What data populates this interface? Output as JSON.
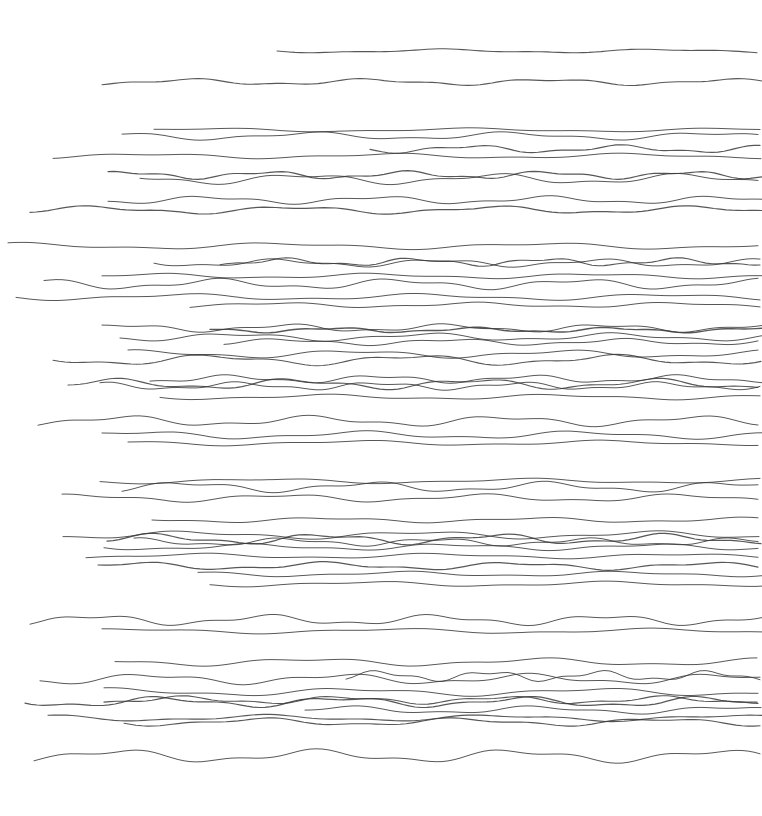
{
  "drawing": {
    "description": "Hand-drawn horizontal wavy pen lines on white paper",
    "background": "#ffffff",
    "stroke_color": "#3a3a3a",
    "width": 762,
    "height": 816,
    "lines": [
      {
        "x1": 277,
        "y": 51,
        "x2": 762,
        "amp": 1.5,
        "wl": 220,
        "w": 1.1
      },
      {
        "x1": 102,
        "y": 82,
        "x2": 762,
        "amp": 2.5,
        "wl": 180,
        "w": 1.1
      },
      {
        "x1": 154,
        "y": 130,
        "x2": 762,
        "amp": 1.5,
        "wl": 260,
        "w": 1.0
      },
      {
        "x1": 122,
        "y": 136,
        "x2": 762,
        "amp": 3,
        "wl": 200,
        "w": 1.0
      },
      {
        "x1": 370,
        "y": 149,
        "x2": 762,
        "amp": 3,
        "wl": 150,
        "w": 1.1
      },
      {
        "x1": 53,
        "y": 156,
        "x2": 762,
        "amp": 2,
        "wl": 240,
        "w": 1.0
      },
      {
        "x1": 108,
        "y": 175,
        "x2": 762,
        "amp": 3,
        "wl": 140,
        "w": 1.2
      },
      {
        "x1": 140,
        "y": 179,
        "x2": 762,
        "amp": 4,
        "wl": 190,
        "w": 1.0
      },
      {
        "x1": 108,
        "y": 200,
        "x2": 762,
        "amp": 3,
        "wl": 170,
        "w": 1.0
      },
      {
        "x1": 30,
        "y": 210,
        "x2": 762,
        "amp": 3,
        "wl": 200,
        "w": 1.2
      },
      {
        "x1": 8,
        "y": 246,
        "x2": 762,
        "amp": 2.5,
        "wl": 260,
        "w": 1.0
      },
      {
        "x1": 154,
        "y": 263,
        "x2": 762,
        "amp": 3,
        "wl": 160,
        "w": 1.0
      },
      {
        "x1": 220,
        "y": 262,
        "x2": 762,
        "amp": 3,
        "wl": 130,
        "w": 1.1
      },
      {
        "x1": 102,
        "y": 276,
        "x2": 762,
        "amp": 2,
        "wl": 220,
        "w": 1.0
      },
      {
        "x1": 44,
        "y": 284,
        "x2": 762,
        "amp": 4,
        "wl": 180,
        "w": 1.0
      },
      {
        "x1": 16,
        "y": 297,
        "x2": 762,
        "amp": 2.5,
        "wl": 240,
        "w": 1.0
      },
      {
        "x1": 190,
        "y": 305,
        "x2": 762,
        "amp": 2,
        "wl": 200,
        "w": 1.0
      },
      {
        "x1": 102,
        "y": 328,
        "x2": 762,
        "amp": 3,
        "wl": 160,
        "w": 1.0
      },
      {
        "x1": 210,
        "y": 330,
        "x2": 762,
        "amp": 2,
        "wl": 140,
        "w": 1.4
      },
      {
        "x1": 120,
        "y": 337,
        "x2": 762,
        "amp": 3,
        "wl": 190,
        "w": 1.0
      },
      {
        "x1": 224,
        "y": 342,
        "x2": 762,
        "amp": 2.5,
        "wl": 170,
        "w": 1.0
      },
      {
        "x1": 128,
        "y": 354,
        "x2": 762,
        "amp": 3,
        "wl": 210,
        "w": 1.0
      },
      {
        "x1": 53,
        "y": 360,
        "x2": 762,
        "amp": 4,
        "wl": 200,
        "w": 1.1
      },
      {
        "x1": 150,
        "y": 379,
        "x2": 762,
        "amp": 3,
        "wl": 150,
        "w": 1.0
      },
      {
        "x1": 68,
        "y": 384,
        "x2": 762,
        "amp": 4,
        "wl": 180,
        "w": 1.1
      },
      {
        "x1": 100,
        "y": 386,
        "x2": 762,
        "amp": 3,
        "wl": 140,
        "w": 1.0
      },
      {
        "x1": 160,
        "y": 397,
        "x2": 762,
        "amp": 2,
        "wl": 230,
        "w": 1.0
      },
      {
        "x1": 38,
        "y": 421,
        "x2": 762,
        "amp": 4,
        "wl": 190,
        "w": 1.0
      },
      {
        "x1": 102,
        "y": 435,
        "x2": 762,
        "amp": 3,
        "wl": 220,
        "w": 1.0
      },
      {
        "x1": 128,
        "y": 443,
        "x2": 762,
        "amp": 2,
        "wl": 250,
        "w": 1.0
      },
      {
        "x1": 100,
        "y": 481,
        "x2": 762,
        "amp": 2,
        "wl": 260,
        "w": 1.0
      },
      {
        "x1": 122,
        "y": 487,
        "x2": 762,
        "amp": 4,
        "wl": 180,
        "w": 1.0
      },
      {
        "x1": 62,
        "y": 498,
        "x2": 762,
        "amp": 3,
        "wl": 200,
        "w": 1.0
      },
      {
        "x1": 152,
        "y": 520,
        "x2": 762,
        "amp": 2,
        "wl": 210,
        "w": 1.0
      },
      {
        "x1": 63,
        "y": 535,
        "x2": 762,
        "amp": 3,
        "wl": 230,
        "w": 1.0
      },
      {
        "x1": 107,
        "y": 539,
        "x2": 762,
        "amp": 4,
        "wl": 170,
        "w": 1.2
      },
      {
        "x1": 134,
        "y": 542,
        "x2": 762,
        "amp": 3,
        "wl": 150,
        "w": 1.0
      },
      {
        "x1": 104,
        "y": 547,
        "x2": 762,
        "amp": 2.5,
        "wl": 200,
        "w": 1.0
      },
      {
        "x1": 86,
        "y": 556,
        "x2": 762,
        "amp": 2,
        "wl": 240,
        "w": 1.0
      },
      {
        "x1": 98,
        "y": 566,
        "x2": 762,
        "amp": 3,
        "wl": 190,
        "w": 1.2
      },
      {
        "x1": 198,
        "y": 574,
        "x2": 762,
        "amp": 2,
        "wl": 220,
        "w": 1.0
      },
      {
        "x1": 210,
        "y": 584,
        "x2": 762,
        "amp": 2,
        "wl": 240,
        "w": 1.0
      },
      {
        "x1": 30,
        "y": 620,
        "x2": 762,
        "amp": 4,
        "wl": 170,
        "w": 1.0
      },
      {
        "x1": 102,
        "y": 631,
        "x2": 762,
        "amp": 2,
        "wl": 260,
        "w": 1.0
      },
      {
        "x1": 115,
        "y": 662,
        "x2": 762,
        "amp": 3,
        "wl": 230,
        "w": 1.0
      },
      {
        "x1": 40,
        "y": 679,
        "x2": 762,
        "amp": 4,
        "wl": 190,
        "w": 1.0
      },
      {
        "x1": 346,
        "y": 676,
        "x2": 762,
        "amp": 4,
        "wl": 110,
        "w": 1.0
      },
      {
        "x1": 104,
        "y": 692,
        "x2": 762,
        "amp": 3,
        "wl": 240,
        "w": 1.0
      },
      {
        "x1": 25,
        "y": 702,
        "x2": 762,
        "amp": 4,
        "wl": 180,
        "w": 1.2
      },
      {
        "x1": 104,
        "y": 700,
        "x2": 762,
        "amp": 3,
        "wl": 160,
        "w": 1.1
      },
      {
        "x1": 305,
        "y": 710,
        "x2": 762,
        "amp": 3,
        "wl": 190,
        "w": 1.0
      },
      {
        "x1": 48,
        "y": 718,
        "x2": 762,
        "amp": 2.5,
        "wl": 230,
        "w": 1.1
      },
      {
        "x1": 124,
        "y": 722,
        "x2": 762,
        "amp": 3,
        "wl": 200,
        "w": 1.1
      },
      {
        "x1": 34,
        "y": 756,
        "x2": 762,
        "amp": 5,
        "wl": 200,
        "w": 1.0
      }
    ]
  }
}
